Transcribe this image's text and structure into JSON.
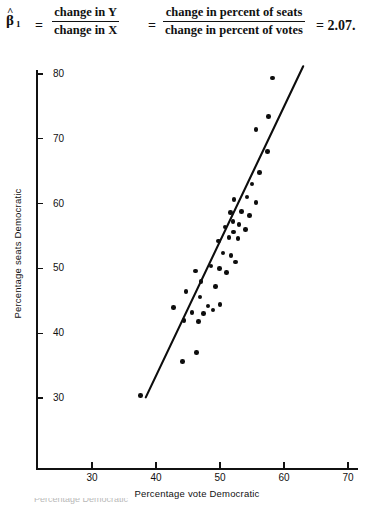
{
  "formula": {
    "beta_symbol": "β",
    "beta_hat": "^",
    "beta_subscript": "1",
    "equals_1": "=",
    "fraction_1": {
      "numerator": "change in  Y",
      "denominator": "change in  X"
    },
    "equals_2": "=",
    "fraction_2": {
      "numerator": "change in percent of seats",
      "denominator": "change in percent of votes"
    },
    "result": "= 2.07."
  },
  "footer": {
    "caption_partial": "Percentage Democratic"
  },
  "chart_data": {
    "type": "scatter",
    "title": "",
    "xlabel": "Percentage vote Democratic",
    "ylabel": "Percentage seats Democratic",
    "xlim": [
      21,
      73
    ],
    "ylim": [
      22,
      83
    ],
    "xticks": [
      30,
      40,
      50,
      60,
      70
    ],
    "yticks": [
      30,
      40,
      50,
      60,
      70,
      80
    ],
    "grid": false,
    "legend": null,
    "points": [
      {
        "x": 37.6,
        "y": 30.4
      },
      {
        "x": 44.1,
        "y": 35.6
      },
      {
        "x": 46.3,
        "y": 37.0
      },
      {
        "x": 42.7,
        "y": 44.0
      },
      {
        "x": 44.4,
        "y": 42.0
      },
      {
        "x": 45.6,
        "y": 43.2
      },
      {
        "x": 46.6,
        "y": 41.8
      },
      {
        "x": 47.4,
        "y": 43.0
      },
      {
        "x": 46.9,
        "y": 45.6
      },
      {
        "x": 48.1,
        "y": 44.2
      },
      {
        "x": 48.9,
        "y": 43.6
      },
      {
        "x": 50.0,
        "y": 44.4
      },
      {
        "x": 44.7,
        "y": 46.4
      },
      {
        "x": 47.0,
        "y": 48.0
      },
      {
        "x": 49.3,
        "y": 47.2
      },
      {
        "x": 46.2,
        "y": 49.6
      },
      {
        "x": 48.6,
        "y": 50.4
      },
      {
        "x": 49.9,
        "y": 50.0
      },
      {
        "x": 51.0,
        "y": 49.4
      },
      {
        "x": 50.5,
        "y": 52.4
      },
      {
        "x": 51.7,
        "y": 52.0
      },
      {
        "x": 52.4,
        "y": 51.0
      },
      {
        "x": 49.8,
        "y": 54.2
      },
      {
        "x": 51.4,
        "y": 54.8
      },
      {
        "x": 52.1,
        "y": 55.6
      },
      {
        "x": 52.8,
        "y": 54.6
      },
      {
        "x": 50.8,
        "y": 56.4
      },
      {
        "x": 52.0,
        "y": 57.2
      },
      {
        "x": 53.0,
        "y": 56.8
      },
      {
        "x": 54.0,
        "y": 56.0
      },
      {
        "x": 51.6,
        "y": 58.6
      },
      {
        "x": 53.4,
        "y": 58.8
      },
      {
        "x": 54.6,
        "y": 58.2
      },
      {
        "x": 52.2,
        "y": 60.6
      },
      {
        "x": 54.2,
        "y": 61.0
      },
      {
        "x": 55.6,
        "y": 60.2
      },
      {
        "x": 55.0,
        "y": 63.0
      },
      {
        "x": 56.2,
        "y": 64.8
      },
      {
        "x": 57.4,
        "y": 68.0
      },
      {
        "x": 55.6,
        "y": 71.4
      },
      {
        "x": 57.6,
        "y": 73.4
      },
      {
        "x": 58.2,
        "y": 79.4
      }
    ],
    "trendline": {
      "label": "regression line",
      "x_start": 38.4,
      "y_start": 30.1,
      "x_end": 63.0,
      "y_end": 81.2,
      "slope": 2.07
    }
  }
}
